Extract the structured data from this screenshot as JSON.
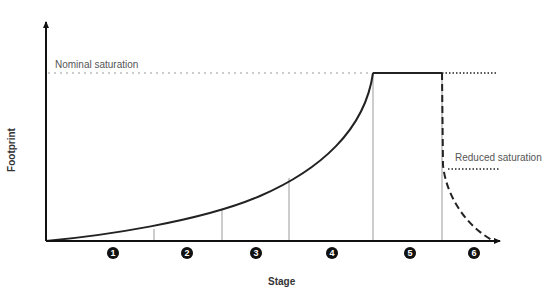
{
  "axes": {
    "x_label": "Stage",
    "y_label": "Footprint"
  },
  "annotations": {
    "nominal": "Nominal saturation",
    "reduced": "Reduced saturation"
  },
  "stages": [
    {
      "label": "1",
      "x": 113
    },
    {
      "label": "2",
      "x": 187
    },
    {
      "label": "3",
      "x": 256
    },
    {
      "label": "4",
      "x": 332
    },
    {
      "label": "5",
      "x": 410
    },
    {
      "label": "6",
      "x": 474
    }
  ],
  "colors": {
    "curve": "#222222",
    "axis": "#111111",
    "divider": "#999999",
    "guide": "#888888",
    "label": "#555555"
  }
}
